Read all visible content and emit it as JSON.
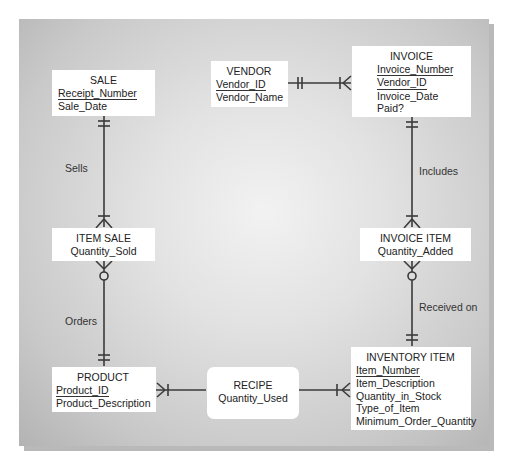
{
  "diagram": {
    "type": "entity-relationship",
    "notation": "crow's foot",
    "entities": {
      "sale": {
        "name": "SALE",
        "primary_keys": [
          "Receipt_Number"
        ],
        "attributes": [
          "Sale_Date"
        ]
      },
      "vendor": {
        "name": "VENDOR",
        "primary_keys": [
          "Vendor_ID"
        ],
        "attributes": [
          "Vendor_Name"
        ]
      },
      "invoice": {
        "name": "INVOICE",
        "primary_keys": [
          "Invoice_Number",
          "Vendor_ID"
        ],
        "attributes": [
          "Invoice_Date",
          "Paid?"
        ]
      },
      "item_sale": {
        "name": "ITEM SALE",
        "attributes": [
          "Quantity_Sold"
        ]
      },
      "invoice_item": {
        "name": "INVOICE ITEM",
        "attributes": [
          "Quantity_Added"
        ]
      },
      "product": {
        "name": "PRODUCT",
        "primary_keys": [
          "Product_ID"
        ],
        "attributes": [
          "Product_Description"
        ]
      },
      "recipe": {
        "name": "RECIPE",
        "attributes": [
          "Quantity_Used"
        ]
      },
      "inventory_item": {
        "name": "INVENTORY ITEM",
        "primary_keys": [
          "Item_Number"
        ],
        "attributes": [
          "Item_Description",
          "Quantity_in_Stock",
          "Type_of_Item",
          "Minimum_Order_Quantity"
        ]
      }
    },
    "relationships": [
      {
        "from": "SALE",
        "to": "ITEM SALE",
        "label": "Sells",
        "from_card": "one and only one",
        "to_card": "one or many"
      },
      {
        "from": "VENDOR",
        "to": "INVOICE",
        "label": "",
        "from_card": "one and only one",
        "to_card": "one or many"
      },
      {
        "from": "INVOICE",
        "to": "INVOICE ITEM",
        "label": "Includes",
        "from_card": "one and only one",
        "to_card": "one or many"
      },
      {
        "from": "PRODUCT",
        "to": "ITEM SALE",
        "label": "Orders",
        "from_card": "one and only one",
        "to_card": "zero or many"
      },
      {
        "from": "INVENTORY ITEM",
        "to": "INVOICE ITEM",
        "label": "Received on",
        "from_card": "one and only one",
        "to_card": "zero or many"
      },
      {
        "from": "RECIPE",
        "to": "PRODUCT",
        "label": "",
        "from_card": "",
        "to_card": "one or many"
      },
      {
        "from": "RECIPE",
        "to": "INVENTORY ITEM",
        "label": "",
        "from_card": "",
        "to_card": "one or many"
      }
    ],
    "labels": {
      "sells": "Sells",
      "includes": "Includes",
      "orders": "Orders",
      "received_on": "Received on"
    },
    "colors": {
      "line": "#3a3a3a",
      "entity_bg": "#ffffff",
      "panel_center": "#f2f2f2",
      "panel_edge": "#b3b3b3"
    }
  }
}
